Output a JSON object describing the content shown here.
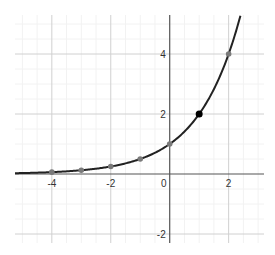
{
  "chart_data": {
    "type": "line",
    "title": "",
    "function": "y = 2^x",
    "xlabel": "",
    "ylabel": "",
    "xlim": [
      -5.25,
      3.2
    ],
    "ylim": [
      -2.3,
      5.3
    ],
    "grid": true,
    "legend": null,
    "x_ticks": [
      -4,
      -2,
      0,
      2
    ],
    "y_ticks": [
      -2,
      2,
      4
    ],
    "x_tick_labels": [
      "-4",
      "-2",
      "0",
      "2"
    ],
    "y_tick_labels": [
      "-2",
      "2",
      "4"
    ],
    "series": [
      {
        "name": "2^x",
        "color": "#222222",
        "x": [
          -5.25,
          -5,
          -4,
          -3,
          -2,
          -1,
          0,
          1,
          2,
          2.4
        ],
        "y": [
          0.026,
          0.031,
          0.0625,
          0.125,
          0.25,
          0.5,
          1,
          2,
          4,
          5.28
        ]
      }
    ],
    "points": [
      {
        "x": -4,
        "y": 0.0625,
        "color": "#7a7a7a",
        "highlighted": false
      },
      {
        "x": -3,
        "y": 0.125,
        "color": "#7a7a7a",
        "highlighted": false
      },
      {
        "x": -2,
        "y": 0.25,
        "color": "#7a7a7a",
        "highlighted": false
      },
      {
        "x": -1,
        "y": 0.5,
        "color": "#7a7a7a",
        "highlighted": false
      },
      {
        "x": 0,
        "y": 1,
        "color": "#7a7a7a",
        "highlighted": false
      },
      {
        "x": 1,
        "y": 2,
        "color": "#000000",
        "highlighted": true
      },
      {
        "x": 2,
        "y": 4,
        "color": "#7a7a7a",
        "highlighted": false
      }
    ]
  },
  "colors": {
    "axis": "#555555",
    "major_grid": "#d0d0d0",
    "minor_grid": "#f2f2f2",
    "curve": "#222222",
    "point": "#7a7a7a",
    "highlight_point": "#000000"
  }
}
